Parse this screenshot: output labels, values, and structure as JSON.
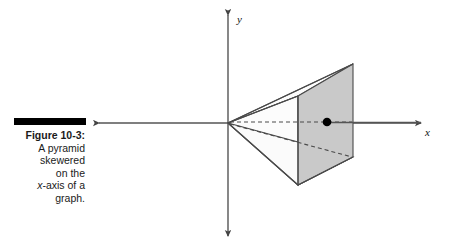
{
  "figure": {
    "caption_title": "Figure 10-3:",
    "caption_lines": [
      "A pyramid",
      "skewered",
      "on the"
    ],
    "caption_line_italic_prefix": "x",
    "caption_line_italic_rest": "-axis of a",
    "caption_last_line": "graph.",
    "rule_color": "#000000"
  },
  "graph": {
    "x_axis_label": "x",
    "y_axis_label": "y",
    "axis_color": "#555555",
    "origin": {
      "x": 228,
      "y": 123
    },
    "x_axis": {
      "x_start": 92,
      "x_end": 428,
      "y": 123
    },
    "y_axis": {
      "y_start": 8,
      "y_end": 243,
      "x": 228
    },
    "point_marker": {
      "x": 327,
      "y": 122,
      "radius": 4,
      "color": "#000000"
    },
    "solid_line_color": "#4a4a4a",
    "dashed_line_color": "#4a4a4a",
    "face_fill_color": "#c9c9c9",
    "face_fill_light": "#ffffff"
  },
  "shape": {
    "name": "pyramid",
    "apex": {
      "x": 228,
      "y": 123
    },
    "vertices": {
      "top_back": {
        "x": 353,
        "y": 64
      },
      "top_front": {
        "x": 298,
        "y": 96
      },
      "bottom_front": {
        "x": 298,
        "y": 185
      },
      "bottom_back": {
        "x": 353,
        "y": 157
      },
      "right_mid_lower": {
        "x": 353,
        "y": 157
      }
    }
  }
}
